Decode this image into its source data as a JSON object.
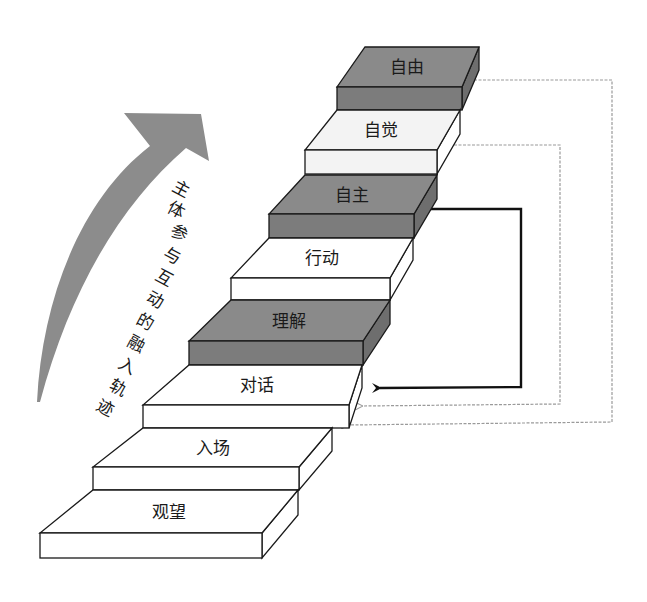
{
  "diagram": {
    "title_vertical": "主体参与互动的融入轨迹",
    "title_chars": [
      "主",
      "体",
      "参",
      "与",
      "互",
      "动",
      "的",
      "融",
      "入",
      "轨",
      "迹"
    ],
    "colors": {
      "dark_step": "#8a8a8a",
      "dark_step_front": "#7c7c7c",
      "dark_step_side": "#6e6e6e",
      "light_step": "#ffffff",
      "light_step_tint": "#f3f3f3",
      "outline": "#1a1a1a",
      "big_arrow": "#8c8c8c",
      "loop_dotted": "#9a9a9a",
      "loop_solid": "#111111"
    },
    "steps": [
      {
        "label": "观望",
        "shade": "light"
      },
      {
        "label": "入场",
        "shade": "light"
      },
      {
        "label": "对话",
        "shade": "light"
      },
      {
        "label": "理解",
        "shade": "dark"
      },
      {
        "label": "行动",
        "shade": "light"
      },
      {
        "label": "自主",
        "shade": "dark"
      },
      {
        "label": "自觉",
        "shade": "light"
      },
      {
        "label": "自由",
        "shade": "dark"
      }
    ],
    "loops": [
      {
        "from": "自主",
        "to": "对话",
        "style": "solid"
      },
      {
        "from": "自觉",
        "to": "对话",
        "style": "dotted"
      },
      {
        "from": "自由",
        "to": "入场",
        "style": "dotted"
      }
    ]
  }
}
